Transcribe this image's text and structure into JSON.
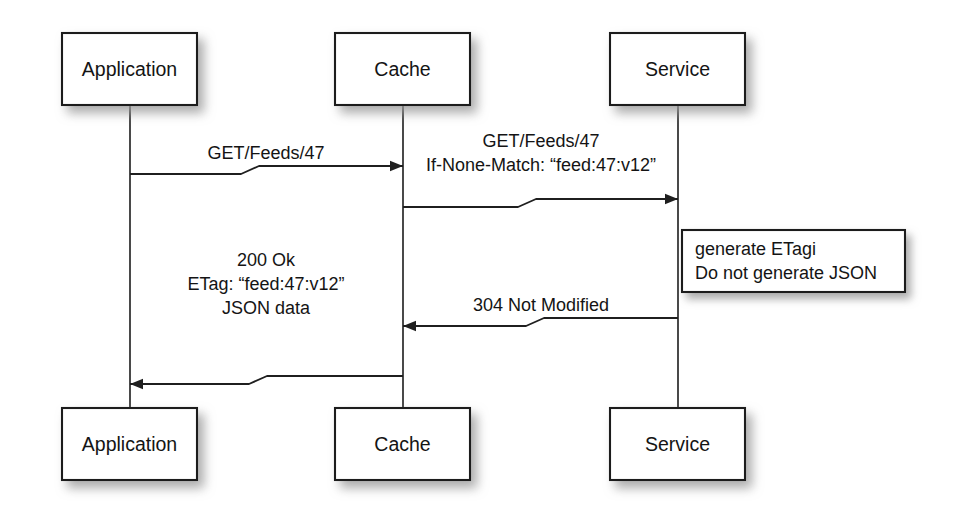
{
  "diagram": {
    "type": "sequence-diagram",
    "background_color": "#ffffff",
    "line_color": "#1f1f1f",
    "text_color": "#141414",
    "shadow_color": "#b8b8b8"
  },
  "participants": [
    {
      "id": "application",
      "label": "Application",
      "lifeline_x": 130,
      "top_box": {
        "x": 62,
        "y": 33,
        "w": 135,
        "h": 72
      },
      "bottom_box": {
        "x": 62,
        "y": 408,
        "w": 135,
        "h": 72
      }
    },
    {
      "id": "cache",
      "label": "Cache",
      "lifeline_x": 403,
      "top_box": {
        "x": 335,
        "y": 33,
        "w": 135,
        "h": 72
      },
      "bottom_box": {
        "x": 335,
        "y": 408,
        "w": 135,
        "h": 72
      }
    },
    {
      "id": "service",
      "label": "Service",
      "lifeline_x": 678,
      "top_box": {
        "x": 610,
        "y": 33,
        "w": 135,
        "h": 72
      },
      "bottom_box": {
        "x": 610,
        "y": 408,
        "w": 135,
        "h": 72
      }
    }
  ],
  "messages": [
    {
      "id": "msg-get-feeds-app-to-cache",
      "from": "application",
      "to": "cache",
      "direction": "right",
      "lines": [
        "GET/Feeds/47"
      ],
      "label_x": 266,
      "label_baseline_first": 159,
      "line_from_x": 130,
      "line_to_x": 403,
      "y_start": 174,
      "y_end": 166,
      "jog_x": 250
    },
    {
      "id": "msg-get-feeds-cache-to-service",
      "from": "cache",
      "to": "service",
      "direction": "right",
      "lines": [
        "GET/Feeds/47",
        "If-None-Match: “feed:47:v12”"
      ],
      "label_x": 541,
      "label_baseline_first": 171,
      "line_from_x": 403,
      "line_to_x": 678,
      "y_start": 207,
      "y_end": 199,
      "jog_x": 527
    },
    {
      "id": "msg-304-service-to-cache",
      "from": "service",
      "to": "cache",
      "direction": "left",
      "lines": [
        "304 Not Modified"
      ],
      "label_x": 541,
      "label_baseline_first": 311,
      "line_from_x": 678,
      "line_to_x": 403,
      "y_start": 318,
      "y_end": 326,
      "jog_x": 535
    },
    {
      "id": "msg-200-ok-cache-to-app",
      "from": "cache",
      "to": "application",
      "direction": "left",
      "lines": [
        "200 Ok",
        "ETag: “feed:47:v12”",
        "JSON data"
      ],
      "label_x": 266,
      "label_baseline_first": 314,
      "line_from_x": 403,
      "line_to_x": 130,
      "y_start": 376,
      "y_end": 384,
      "jog_x": 258
    }
  ],
  "notes": [
    {
      "id": "note-service-etag",
      "attached_to": "service",
      "lines": [
        "generate ETagi",
        "Do not generate JSON"
      ],
      "box": {
        "x": 682,
        "y": 230,
        "w": 223,
        "h": 62
      },
      "text_x": 695,
      "text_baseline_first": 255
    }
  ]
}
